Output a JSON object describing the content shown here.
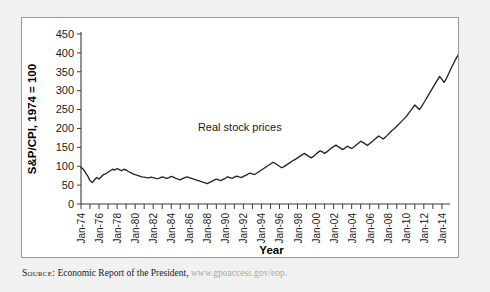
{
  "figure": {
    "source_label": "Source:",
    "source_text": "Economic Report of the President,",
    "source_url": "www.gpoaccess.gov/eop.",
    "url_color": "#a9a9a9"
  },
  "chart_data": {
    "type": "line",
    "title": "",
    "xlabel": "Year",
    "ylabel": "S&P/CPI, 1974 = 100",
    "ylim": [
      0,
      450
    ],
    "ytick_labels": [
      "0",
      "50",
      "100",
      "150",
      "200",
      "250",
      "300",
      "350",
      "400",
      "450"
    ],
    "yticks": [
      0,
      50,
      100,
      150,
      200,
      250,
      300,
      350,
      400,
      450
    ],
    "grid": false,
    "legend": "none",
    "annotations": [
      {
        "text": "Real stock prices",
        "x": 1991.6,
        "y": 192
      }
    ],
    "xtick_labels": [
      "Jan-74",
      "Jan-76",
      "Jan-78",
      "Jan-80",
      "Jan-82",
      "Jan-84",
      "Jan-86",
      "Jan-88",
      "Jan-90",
      "Jan-92",
      "Jan-94",
      "Jan-96",
      "Jan-98",
      "Jan-00",
      "Jan-02",
      "Jan-04",
      "Jan-06",
      "Jan-08",
      "Jan-10",
      "Jan-12",
      "Jan-14"
    ],
    "xticks": [
      1974,
      1976,
      1978,
      1980,
      1982,
      1984,
      1986,
      1988,
      1990,
      1992,
      1994,
      1996,
      1998,
      2000,
      2002,
      2004,
      2006,
      2008,
      2010,
      2012,
      2014
    ],
    "xlim": [
      1974,
      2014.9
    ],
    "minor_xticks_every": 1,
    "series": [
      {
        "name": "Real stock prices",
        "color": "#262626",
        "x_start": 1974.0,
        "x_step": 0.25,
        "values": [
          97,
          92,
          83,
          74,
          62,
          57,
          64,
          70,
          66,
          72,
          78,
          80,
          84,
          88,
          92,
          90,
          94,
          91,
          88,
          92,
          90,
          86,
          83,
          80,
          78,
          76,
          74,
          72,
          71,
          70,
          69,
          71,
          70,
          68,
          67,
          69,
          72,
          70,
          68,
          70,
          73,
          71,
          68,
          66,
          64,
          67,
          70,
          72,
          70,
          68,
          66,
          64,
          62,
          60,
          58,
          56,
          54,
          57,
          60,
          63,
          66,
          64,
          62,
          65,
          68,
          72,
          70,
          68,
          71,
          74,
          72,
          70,
          73,
          76,
          79,
          82,
          80,
          78,
          82,
          86,
          90,
          94,
          98,
          102,
          106,
          110,
          108,
          104,
          100,
          96,
          99,
          103,
          107,
          111,
          115,
          118,
          122,
          126,
          130,
          134,
          130,
          126,
          122,
          126,
          131,
          136,
          141,
          138,
          134,
          138,
          143,
          148,
          152,
          156,
          152,
          148,
          144,
          148,
          153,
          150,
          147,
          151,
          156,
          161,
          166,
          163,
          159,
          155,
          160,
          165,
          170,
          175,
          180,
          176,
          172,
          177,
          183,
          189,
          195,
          200,
          206,
          212,
          218,
          224,
          230,
          238,
          246,
          254,
          262,
          256,
          250,
          258,
          268,
          278,
          288,
          298,
          308,
          318,
          328,
          338,
          330,
          322,
          332,
          345,
          358,
          370,
          382,
          392,
          400,
          408,
          413,
          405,
          398,
          406,
          412,
          404,
          392,
          378,
          362,
          345,
          328,
          312,
          296,
          280,
          264,
          248,
          232,
          218,
          206,
          198,
          210,
          222,
          232,
          226,
          234,
          242,
          250,
          244,
          252,
          260,
          255,
          262,
          270,
          265,
          272,
          280,
          288,
          296,
          304,
          312,
          320,
          328,
          336,
          330,
          322,
          310,
          296,
          278,
          256,
          232,
          208,
          186,
          168,
          178,
          192,
          206,
          218,
          228,
          238,
          232,
          224,
          234,
          246,
          258,
          252,
          262,
          274,
          286,
          298,
          310,
          320,
          330,
          342,
          354,
          366,
          360,
          370,
          382,
          390,
          386,
          392,
          396
        ]
      }
    ]
  }
}
